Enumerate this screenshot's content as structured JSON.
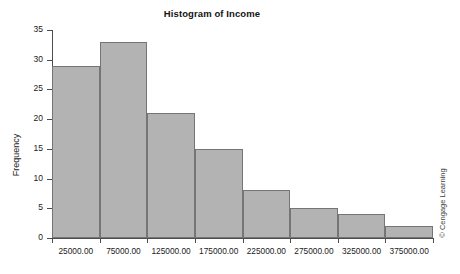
{
  "chart_data": {
    "type": "bar",
    "title": "Histogram of Income",
    "xlabel": "",
    "ylabel": "Frequency",
    "categories": [
      "25000.00",
      "75000.00",
      "125000.00",
      "175000.00",
      "225000.00",
      "275000.00",
      "325000.00",
      "375000.00"
    ],
    "values": [
      29,
      33,
      21,
      15,
      8,
      5,
      4,
      2
    ],
    "ylim": [
      0,
      35
    ],
    "ytick_labels": [
      "0",
      "5",
      "10",
      "15",
      "20",
      "25",
      "30",
      "35"
    ],
    "ytick_values": [
      0,
      5,
      10,
      15,
      20,
      25,
      30,
      35
    ],
    "grid": false,
    "legend": null,
    "bar_fill_color": "#b3b3b3",
    "bar_border_color": "#757575",
    "axis_color": "#4d4d4d",
    "background_color": "#ffffff"
  },
  "figure": {
    "credit": "© Cengage Learning"
  }
}
